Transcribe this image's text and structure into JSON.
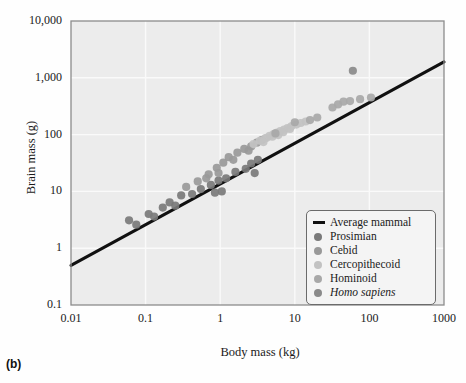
{
  "panel": {
    "label": "(b)"
  },
  "chart_data": {
    "type": "scatter",
    "title": "",
    "xlabel": "Body mass (kg)",
    "ylabel": "Brain mass (g)",
    "xscale": "log",
    "yscale": "log",
    "xlim": [
      0.01,
      1000
    ],
    "ylim": [
      0.1,
      10000
    ],
    "grid": true,
    "xticks": [
      "0.01",
      "0.1",
      "1",
      "10",
      "100",
      "1000"
    ],
    "xtick_values": [
      0.01,
      0.1,
      1,
      10,
      100,
      1000
    ],
    "yticks": [
      "0.1",
      "1",
      "10",
      "100",
      "1,000",
      "10,000"
    ],
    "ytick_values": [
      0.1,
      1,
      10,
      100,
      1000,
      10000
    ],
    "legend_position": "bottom-right",
    "trendline": {
      "name": "Average mammal",
      "color": "#111111",
      "x": [
        0.01,
        1000
      ],
      "y": [
        0.5,
        1900
      ]
    },
    "series": [
      {
        "name": "Prosimian",
        "color": "#7a7a7a",
        "points": [
          [
            0.06,
            3.1
          ],
          [
            0.075,
            2.6
          ],
          [
            0.11,
            4.0
          ],
          [
            0.13,
            3.6
          ],
          [
            0.17,
            5.2
          ],
          [
            0.21,
            6.4
          ],
          [
            0.25,
            5.6
          ],
          [
            0.3,
            8.5
          ],
          [
            0.42,
            9.0
          ],
          [
            0.55,
            11.0
          ],
          [
            0.75,
            13.0
          ],
          [
            0.95,
            15.5
          ],
          [
            1.2,
            17.0
          ],
          [
            1.6,
            22.0
          ],
          [
            2.2,
            25.0
          ],
          [
            2.6,
            31.0
          ],
          [
            3.2,
            36.0
          ],
          [
            1.05,
            10.0
          ],
          [
            0.85,
            9.5
          ],
          [
            2.9,
            21.0
          ]
        ]
      },
      {
        "name": "Cebid",
        "color": "#999999",
        "points": [
          [
            0.35,
            12.0
          ],
          [
            0.5,
            15.0
          ],
          [
            0.7,
            20.0
          ],
          [
            0.9,
            26.0
          ],
          [
            1.1,
            32.0
          ],
          [
            1.3,
            40.0
          ],
          [
            1.7,
            48.0
          ],
          [
            2.1,
            56.0
          ],
          [
            2.6,
            62.0
          ],
          [
            3.1,
            72.0
          ],
          [
            3.6,
            80.0
          ],
          [
            0.65,
            17.0
          ],
          [
            1.5,
            36.0
          ],
          [
            2.4,
            52.0
          ],
          [
            0.95,
            21.0
          ]
        ]
      },
      {
        "name": "Cercopithecoid",
        "color": "#c2c2c2",
        "points": [
          [
            2.8,
            68.0
          ],
          [
            3.4,
            78.0
          ],
          [
            4.0,
            86.0
          ],
          [
            4.6,
            95.0
          ],
          [
            5.2,
            102.0
          ],
          [
            5.8,
            108.0
          ],
          [
            6.4,
            115.0
          ],
          [
            7.2,
            122.0
          ],
          [
            8.0,
            130.0
          ],
          [
            9.0,
            140.0
          ],
          [
            10.5,
            150.0
          ],
          [
            12.0,
            160.0
          ],
          [
            14.0,
            170.0
          ],
          [
            5.0,
            92.0
          ],
          [
            6.0,
            98.0
          ],
          [
            7.0,
            110.0
          ],
          [
            4.2,
            88.0
          ],
          [
            8.6,
            126.0
          ],
          [
            3.8,
            74.0
          ],
          [
            5.5,
            104.0
          ]
        ]
      },
      {
        "name": "Hominoid",
        "color": "#a8a8a8",
        "points": [
          [
            5.5,
            105.0
          ],
          [
            10.0,
            165.0
          ],
          [
            20.0,
            200.0
          ],
          [
            38.0,
            340.0
          ],
          [
            45.0,
            380.0
          ],
          [
            75.0,
            420.0
          ],
          [
            105.0,
            450.0
          ],
          [
            55.0,
            390.0
          ],
          [
            32.0,
            300.0
          ],
          [
            16.0,
            180.0
          ]
        ]
      },
      {
        "name": "Homo sapiens",
        "color": "#8a8a8a",
        "points": [
          [
            60.0,
            1330.0
          ]
        ]
      }
    ]
  },
  "legend": {
    "entries": [
      {
        "label": "Average mammal",
        "marker": "line",
        "color": "#111111",
        "italic": false
      },
      {
        "label": "Prosimian",
        "marker": "circle",
        "color": "#7a7a7a",
        "italic": false
      },
      {
        "label": "Cebid",
        "marker": "circle",
        "color": "#999999",
        "italic": false
      },
      {
        "label": "Cercopithecoid",
        "marker": "circle",
        "color": "#c2c2c2",
        "italic": false
      },
      {
        "label": "Hominoid",
        "marker": "circle",
        "color": "#a8a8a8",
        "italic": false
      },
      {
        "label": "Homo sapiens",
        "marker": "circle",
        "color": "#8a8a8a",
        "italic": true
      }
    ]
  },
  "style": {
    "plot_background": "#ececec",
    "grid_color": "#fafafa",
    "frame_color": "#8c8c8c",
    "page_background": "#fefefe"
  }
}
